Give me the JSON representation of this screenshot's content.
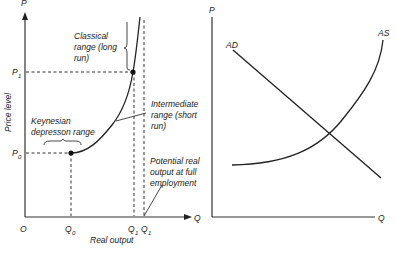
{
  "left_diagram": {
    "y_axis_label": "P",
    "x_axis_label": "Q",
    "origin_label": "O",
    "y_title": "Price level",
    "x_title": "Real output",
    "p1_label": "P",
    "p1_sub": "1",
    "p0_label": "P",
    "p0_sub": "0",
    "q0_label": "Q",
    "q0_sub": "0",
    "q1a_label": "Q",
    "q1a_sub": "1",
    "q1b_label": "Q",
    "q1b_sub": "1",
    "classical": [
      "Classical",
      "range (long",
      "run)"
    ],
    "intermediate": [
      "Intermediate",
      "range (short",
      "run)"
    ],
    "keynesian": [
      "Keynesian",
      "depresson range"
    ],
    "potential": [
      "Potential real",
      "output at full",
      "employment"
    ]
  },
  "right_diagram": {
    "y_axis_label": "P",
    "x_axis_label": "Q",
    "ad_label": "AD",
    "as_label": "AS"
  },
  "colors": {
    "ink": "#222222",
    "background": "#ffffff"
  }
}
